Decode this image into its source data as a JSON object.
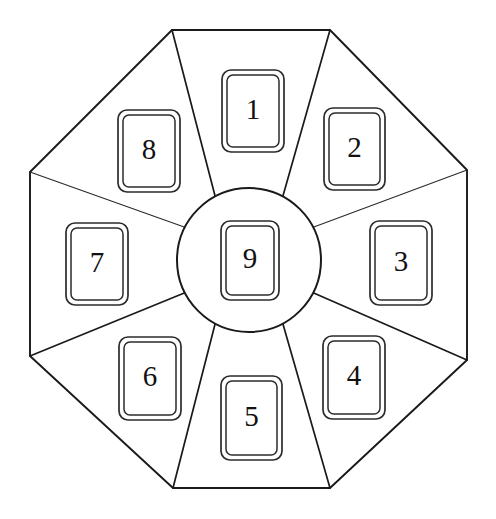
{
  "canvas": {
    "width": 496,
    "height": 519,
    "background_color": "#ffffff",
    "line_color": "#1a1a1a",
    "title": "Octagonal card arrangement"
  },
  "octagon": {
    "name": "octagon-outline",
    "vertices": [
      {
        "id": "v-top-left",
        "x": 172,
        "y": 30
      },
      {
        "id": "v-top-right",
        "x": 330,
        "y": 30
      },
      {
        "id": "v-right-top",
        "x": 467,
        "y": 170
      },
      {
        "id": "v-right-bottom",
        "x": 467,
        "y": 360
      },
      {
        "id": "v-bottom-right",
        "x": 330,
        "y": 488
      },
      {
        "id": "v-bottom-left",
        "x": 173,
        "y": 488
      },
      {
        "id": "v-left-bottom",
        "x": 30,
        "y": 356
      },
      {
        "id": "v-left-top",
        "x": 30,
        "y": 172
      }
    ]
  },
  "hub": {
    "name": "center-circle",
    "cx": 249,
    "cy": 260,
    "r": 72
  },
  "spokes": [
    {
      "id": "spoke-n-w",
      "from": {
        "x": 172,
        "y": 30
      },
      "to_angle": 118,
      "weight": "normal"
    },
    {
      "id": "spoke-n-e",
      "from": {
        "x": 330,
        "y": 30
      },
      "to_angle": 62,
      "weight": "normal"
    },
    {
      "id": "spoke-e-n",
      "from": {
        "x": 467,
        "y": 170
      },
      "to_angle": 27,
      "weight": "thin"
    },
    {
      "id": "spoke-e-s",
      "from": {
        "x": 467,
        "y": 360
      },
      "to_angle": -27,
      "weight": "normal"
    },
    {
      "id": "spoke-s-e",
      "from": {
        "x": 330,
        "y": 488
      },
      "to_angle": -62,
      "weight": "normal"
    },
    {
      "id": "spoke-s-w",
      "from": {
        "x": 173,
        "y": 488
      },
      "to_angle": -118,
      "weight": "normal"
    },
    {
      "id": "spoke-w-s",
      "from": {
        "x": 30,
        "y": 356
      },
      "to_angle": -153,
      "weight": "normal"
    },
    {
      "id": "spoke-w-n",
      "from": {
        "x": 30,
        "y": 172
      },
      "to_angle": 153,
      "weight": "thin"
    }
  ],
  "cards": [
    {
      "id": "card-1",
      "label": "1",
      "position": "north",
      "x": 222,
      "y": 70,
      "w": 62,
      "h": 82
    },
    {
      "id": "card-2",
      "label": "2",
      "position": "northeast",
      "x": 324,
      "y": 108,
      "w": 61,
      "h": 82
    },
    {
      "id": "card-3",
      "label": "3",
      "position": "east",
      "x": 370,
      "y": 221,
      "w": 62,
      "h": 84
    },
    {
      "id": "card-4",
      "label": "4",
      "position": "southeast",
      "x": 323,
      "y": 336,
      "w": 62,
      "h": 83
    },
    {
      "id": "card-5",
      "label": "5",
      "position": "south",
      "x": 221,
      "y": 376,
      "w": 61,
      "h": 84
    },
    {
      "id": "card-6",
      "label": "6",
      "position": "southwest",
      "x": 119,
      "y": 337,
      "w": 62,
      "h": 83
    },
    {
      "id": "card-7",
      "label": "7",
      "position": "west",
      "x": 66,
      "y": 223,
      "w": 62,
      "h": 82
    },
    {
      "id": "card-8",
      "label": "8",
      "position": "northwest",
      "x": 118,
      "y": 110,
      "w": 62,
      "h": 82
    },
    {
      "id": "card-9",
      "label": "9",
      "position": "center",
      "x": 221,
      "y": 221,
      "w": 58,
      "h": 79
    }
  ],
  "card_style": {
    "outer_radius": 9,
    "inner_inset": 5,
    "inner_radius": 6,
    "fill": "#ffffff",
    "stroke": "#2b2b2b",
    "font_size": 29
  }
}
